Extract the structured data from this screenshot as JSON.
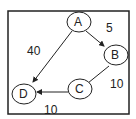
{
  "diagram": {
    "type": "directed-weighted-graph",
    "nodes": [
      {
        "id": "A",
        "label": "A"
      },
      {
        "id": "B",
        "label": "B"
      },
      {
        "id": "C",
        "label": "C"
      },
      {
        "id": "D",
        "label": "D"
      }
    ],
    "edges": [
      {
        "from": "A",
        "to": "B",
        "weight": "5",
        "directed": true
      },
      {
        "from": "A",
        "to": "D",
        "weight": "40",
        "directed": true
      },
      {
        "from": "B",
        "to": "C",
        "weight": "10",
        "directed": false
      },
      {
        "from": "C",
        "to": "D",
        "weight": "10",
        "directed": true
      }
    ],
    "colors": {
      "stroke": "#222222",
      "fill": "#ffffff"
    }
  }
}
